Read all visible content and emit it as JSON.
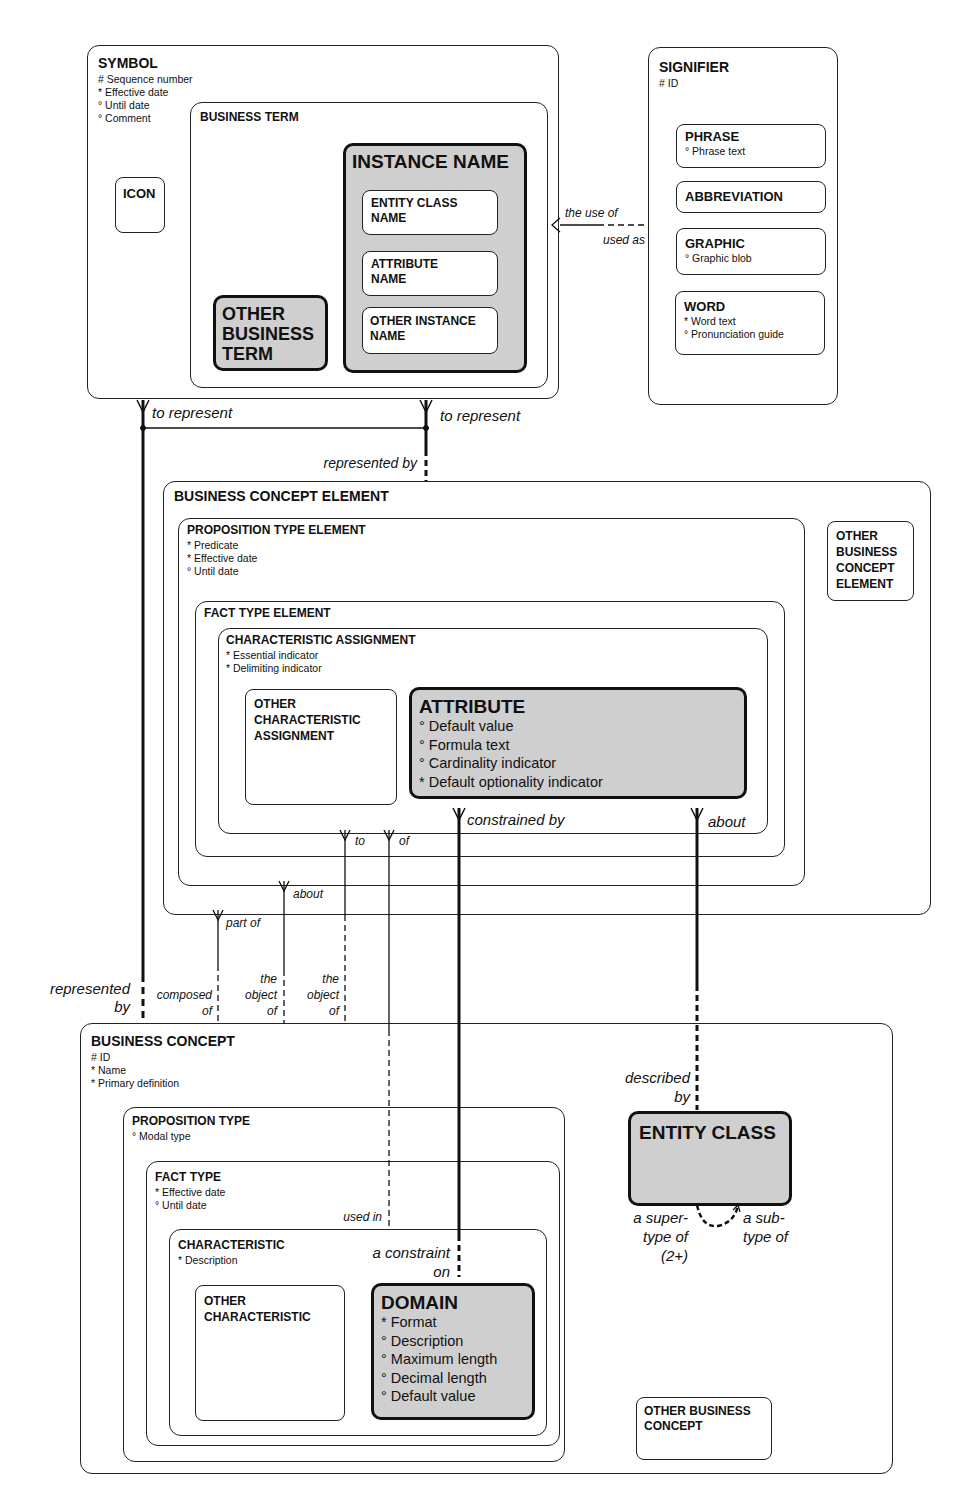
{
  "entities": {
    "symbol": {
      "title": "SYMBOL",
      "attrs": [
        "# Sequence number",
        "* Effective date",
        "° Until date",
        "° Comment"
      ]
    },
    "icon": {
      "title": "ICON"
    },
    "business_term": {
      "title": "BUSINESS TERM"
    },
    "instance_name": {
      "title": "INSTANCE NAME"
    },
    "entity_class_name": {
      "title": "ENTITY CLASS\nNAME"
    },
    "attribute_name": {
      "title": "ATTRIBUTE\nNAME"
    },
    "other_instance_name": {
      "title": "OTHER INSTANCE\nNAME"
    },
    "other_business_term": {
      "title": "OTHER\nBUSINESS\nTERM"
    },
    "signifier": {
      "title": "SIGNIFIER",
      "attrs": [
        "# ID"
      ]
    },
    "phrase": {
      "title": "PHRASE",
      "attrs": [
        "° Phrase text"
      ]
    },
    "abbreviation": {
      "title": "ABBREVIATION"
    },
    "graphic": {
      "title": "GRAPHIC",
      "attrs": [
        "° Graphic blob"
      ]
    },
    "word": {
      "title": "WORD",
      "attrs": [
        "* Word text",
        "° Pronunciation guide"
      ]
    },
    "business_concept_element": {
      "title": "BUSINESS CONCEPT ELEMENT"
    },
    "proposition_type_element": {
      "title": "PROPOSITION TYPE ELEMENT",
      "attrs": [
        "* Predicate",
        "* Effective date",
        "° Until date"
      ]
    },
    "other_business_concept_element": {
      "title": "OTHER\nBUSINESS\nCONCEPT\nELEMENT"
    },
    "fact_type_element": {
      "title": "FACT TYPE ELEMENT"
    },
    "characteristic_assignment": {
      "title": "CHARACTERISTIC ASSIGNMENT",
      "attrs": [
        "* Essential indicator",
        "* Delimiting indicator"
      ]
    },
    "other_characteristic_assignment": {
      "title": "OTHER\nCHARACTERISTIC\nASSIGNMENT"
    },
    "attribute": {
      "title": "ATTRIBUTE",
      "attrs": [
        "° Default value",
        "° Formula text",
        "° Cardinality indicator",
        "* Default optionality indicator"
      ]
    },
    "business_concept": {
      "title": "BUSINESS CONCEPT",
      "attrs": [
        "# ID",
        "* Name",
        "* Primary definition"
      ]
    },
    "proposition_type": {
      "title": "PROPOSITION TYPE",
      "attrs": [
        "° Modal type"
      ]
    },
    "fact_type": {
      "title": "FACT TYPE",
      "attrs": [
        "* Effective date",
        "° Until date"
      ]
    },
    "characteristic": {
      "title": "CHARACTERISTIC",
      "attrs": [
        "* Description"
      ]
    },
    "other_characteristic": {
      "title": "OTHER\nCHARACTERISTIC"
    },
    "domain": {
      "title": "DOMAIN",
      "attrs": [
        "* Format",
        "° Description",
        "° Maximum length",
        "° Decimal length",
        "° Default value"
      ]
    },
    "entity_class": {
      "title": "ENTITY CLASS"
    },
    "other_business_concept": {
      "title": "OTHER BUSINESS\nCONCEPT"
    }
  },
  "relationships": {
    "the_use_of": "the use of",
    "used_as": "used as",
    "to_represent_1": "to represent",
    "to_represent_2": "to represent",
    "represented_by_1": "represented by",
    "represented_by_2": "represented\nby",
    "constrained_by": "constrained by",
    "about_1": "about",
    "to": "to",
    "of": "of",
    "about_2": "about",
    "part_of": "part of",
    "composed_of": "composed\nof",
    "the_object_of_1": "the\nobject\nof",
    "the_object_of_2": "the\nobject\nof",
    "described_by": "described\nby",
    "used_in": "used in",
    "a_constraint_on": "a constraint\non",
    "a_supertype_of": "a super-\ntype of\n(2+)",
    "a_subtype_of": "a sub-\ntype of"
  },
  "colors": {
    "shaded_fill": "#cfcfcf",
    "line": "#111111"
  }
}
